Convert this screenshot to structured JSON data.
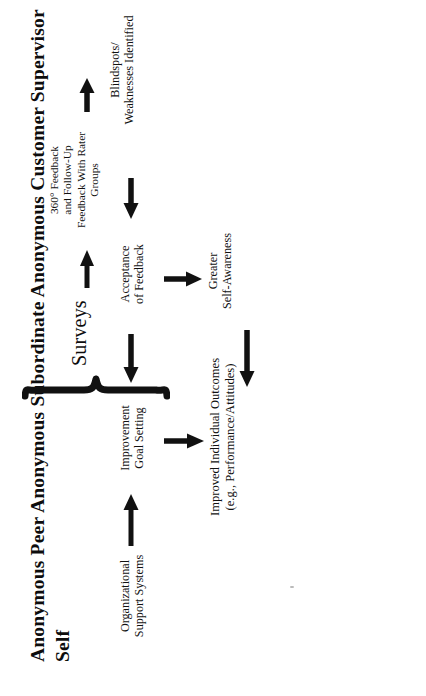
{
  "figure": {
    "orientation": "rotated-90-ccw",
    "background_color": "#ffffff",
    "ink_color": "#111111",
    "rater_sources": {
      "items": [
        "Anonymous Peer",
        "Anonymous Subordinate",
        "Anonymous Customer",
        "Supervisor",
        "Self"
      ],
      "text": "Anonymous Peer\nAnonymous Subordinate\nAnonymous Customer\nSupervisor\nSelf"
    },
    "nodes": {
      "surveys": "Surveys",
      "feedback": "360° Feedback\nand Follow-Up\nFeedback With Rater\nGroups",
      "blindspots": "Blindspots/\nWeaknesses Identified",
      "acceptance": "Acceptance\nof Feedback",
      "self_awareness": "Greater\nSelf-Awareness",
      "goal_setting": "Improvement\nGoal Setting",
      "org_support": "Organizational\nSupport Systems",
      "outcomes": "Improved Individual Outcomes\n(e.g., Performance/Attitudes)"
    },
    "edges": [
      {
        "id": "surveys-to-feedback",
        "from": "surveys",
        "to": "feedback",
        "direction": "right"
      },
      {
        "id": "feedback-to-blindspots",
        "from": "feedback",
        "to": "blindspots",
        "direction": "right"
      },
      {
        "id": "blindspots-to-acceptance",
        "from": "blindspots",
        "to": "acceptance",
        "direction": "up"
      },
      {
        "id": "acceptance-to-self-awareness",
        "from": "acceptance",
        "to": "self_awareness",
        "direction": "right"
      },
      {
        "id": "acceptance-to-goal-setting",
        "from": "acceptance",
        "to": "goal_setting",
        "direction": "up"
      },
      {
        "id": "self-awareness-to-outcomes",
        "from": "self_awareness",
        "to": "outcomes",
        "direction": "up"
      },
      {
        "id": "goal-setting-to-outcomes",
        "from": "goal_setting",
        "to": "outcomes",
        "direction": "right"
      },
      {
        "id": "org-support-to-goal-setting",
        "from": "org_support",
        "to": "goal_setting",
        "direction": "down"
      }
    ]
  }
}
